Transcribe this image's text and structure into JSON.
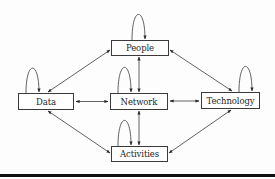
{
  "diagram": {
    "nodes": {
      "people": {
        "label": "People",
        "x": 111,
        "y": 40,
        "w": 58,
        "h": 16
      },
      "data": {
        "label": "Data",
        "x": 18,
        "y": 93,
        "w": 56,
        "h": 17
      },
      "network": {
        "label": "Network",
        "x": 110,
        "y": 93,
        "w": 58,
        "h": 17
      },
      "technology": {
        "label": "Technology",
        "x": 201,
        "y": 92,
        "w": 59,
        "h": 17
      },
      "activities": {
        "label": "Activities",
        "x": 111,
        "y": 146,
        "w": 57,
        "h": 16
      }
    },
    "edges": [
      {
        "from": "data",
        "to": "people",
        "type": "bidirectional"
      },
      {
        "from": "people",
        "to": "technology",
        "type": "bidirectional"
      },
      {
        "from": "data",
        "to": "network",
        "type": "bidirectional"
      },
      {
        "from": "network",
        "to": "technology",
        "type": "bidirectional"
      },
      {
        "from": "people",
        "to": "network",
        "type": "bidirectional"
      },
      {
        "from": "network",
        "to": "activities",
        "type": "bidirectional"
      },
      {
        "from": "data",
        "to": "activities",
        "type": "bidirectional"
      },
      {
        "from": "technology",
        "to": "activities",
        "type": "bidirectional"
      },
      {
        "from": "people",
        "to": "people",
        "type": "self-loop"
      },
      {
        "from": "data",
        "to": "data",
        "type": "self-loop"
      },
      {
        "from": "network",
        "to": "network",
        "type": "self-loop"
      },
      {
        "from": "technology",
        "to": "technology",
        "type": "self-loop"
      },
      {
        "from": "activities",
        "to": "activities",
        "type": "self-loop"
      }
    ],
    "colors": {
      "line": "#3a3a3a",
      "text": "#1e1e1e",
      "rule": "#111111"
    }
  }
}
